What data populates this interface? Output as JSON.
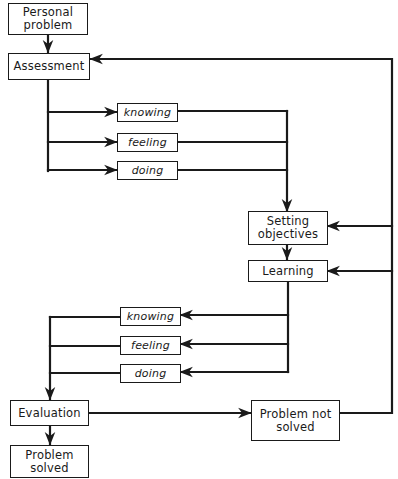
{
  "diagram": {
    "nodes": {
      "personal_problem": "Personal\nproblem",
      "assessment": "Assessment",
      "upper_knowing": "knowing",
      "upper_feeling": "feeling",
      "upper_doing": "doing",
      "setting_objectives": "Setting\nobjectives",
      "learning": "Learning",
      "lower_knowing": "knowing",
      "lower_feeling": "feeling",
      "lower_doing": "doing",
      "evaluation": "Evaluation",
      "problem_not_solved": "Problem not\nsolved",
      "problem_solved": "Problem\nsolved"
    },
    "edges": [
      {
        "from": "Personal problem",
        "to": "Assessment"
      },
      {
        "from": "Assessment",
        "to": "knowing"
      },
      {
        "from": "Assessment",
        "to": "feeling"
      },
      {
        "from": "Assessment",
        "to": "doing"
      },
      {
        "from": "knowing/feeling/doing",
        "to": "Setting objectives"
      },
      {
        "from": "Setting objectives",
        "to": "Learning"
      },
      {
        "from": "Learning",
        "to": "knowing"
      },
      {
        "from": "Learning",
        "to": "feeling"
      },
      {
        "from": "Learning",
        "to": "doing"
      },
      {
        "from": "knowing/feeling/doing",
        "to": "Evaluation"
      },
      {
        "from": "Evaluation",
        "to": "Problem solved"
      },
      {
        "from": "Evaluation",
        "to": "Problem not solved"
      },
      {
        "from": "Problem not solved",
        "to": "Assessment"
      },
      {
        "from": "Problem not solved",
        "to": "Setting objectives"
      },
      {
        "from": "Problem not solved",
        "to": "Learning"
      }
    ],
    "colors": {
      "line": "#1a1a1a",
      "background": "#ffffff"
    }
  }
}
